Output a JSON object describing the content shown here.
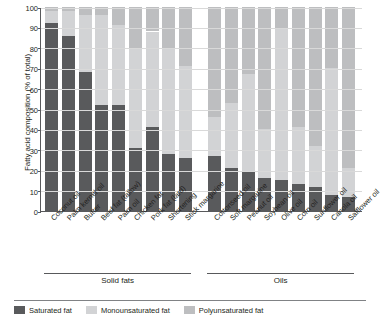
{
  "chart_data": {
    "type": "bar",
    "title": "",
    "xlabel": "",
    "ylabel": "Fatty acid composition (% of total)",
    "ylim": [
      0,
      100
    ],
    "ytick_labels": [
      "0",
      "10",
      "20",
      "30",
      "40",
      "50",
      "60",
      "70",
      "80",
      "90",
      "100"
    ],
    "grid": true,
    "stacked": true,
    "legend_position": "bottom",
    "groups": [
      {
        "name": "Solid fats",
        "count": 9
      },
      {
        "name": "Oils",
        "count": 9
      }
    ],
    "categories": [
      "Coconut oil",
      "Palm kernel oil",
      "Butter",
      "Beef fat (tallow)",
      "Palm oil",
      "Chicken fat",
      "Pork fat (lard)",
      "Shortening",
      "Stick margarine",
      "Cottonseed oil",
      "Soft margarine",
      "Peanut oil",
      "Soybean oil",
      "Olive oil",
      "Corn oil",
      "Sunflower oil",
      "Canola oil",
      "Safflower oil"
    ],
    "series": [
      {
        "name": "Saturated fat",
        "color": "#595a5c",
        "values": [
          92,
          86,
          68,
          52,
          52,
          31,
          41,
          28,
          26,
          27,
          21,
          19,
          16,
          15,
          13,
          12,
          8,
          7
        ]
      },
      {
        "name": "Monounsaturated fat",
        "color": "#d2d3d5",
        "values": [
          6,
          12,
          28,
          44,
          39,
          49,
          47,
          52,
          45,
          19,
          32,
          48,
          24,
          74,
          28,
          20,
          62,
          14
        ]
      },
      {
        "name": "Polyunsaturated fat",
        "color": "#bdbec0",
        "values": [
          2,
          2,
          4,
          4,
          9,
          20,
          12,
          20,
          29,
          54,
          47,
          33,
          60,
          11,
          59,
          68,
          30,
          79
        ]
      }
    ],
    "legend": [
      {
        "label": "Saturated fat",
        "color": "#595a5c"
      },
      {
        "label": "Monounsaturated fat",
        "color": "#d2d3d5"
      },
      {
        "label": "Polyunsaturated fat",
        "color": "#bdbec0"
      }
    ]
  }
}
